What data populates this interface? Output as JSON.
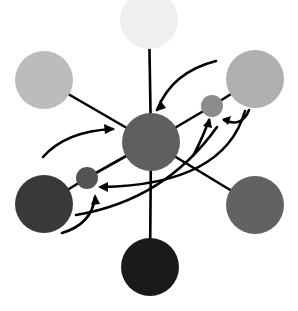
{
  "diagram": {
    "width": 298,
    "height": 311,
    "background": "#ffffff",
    "stroke_color": "#000000",
    "stroke_width": 2.6,
    "nodes": [
      {
        "id": "top",
        "cx": 149,
        "cy": 20,
        "r": 29,
        "fill": "#efefef"
      },
      {
        "id": "upper-left",
        "cx": 44,
        "cy": 80,
        "r": 29,
        "fill": "#bcbcbc"
      },
      {
        "id": "upper-right",
        "cx": 255,
        "cy": 79,
        "r": 29,
        "fill": "#b0b0b0"
      },
      {
        "id": "center",
        "cx": 151,
        "cy": 142,
        "r": 29,
        "fill": "#5f5f5f"
      },
      {
        "id": "small-right",
        "cx": 212,
        "cy": 106,
        "r": 11,
        "fill": "#8c8c8c"
      },
      {
        "id": "small-left",
        "cx": 87,
        "cy": 178,
        "r": 11,
        "fill": "#545454"
      },
      {
        "id": "lower-left",
        "cx": 44,
        "cy": 204,
        "r": 29,
        "fill": "#393939"
      },
      {
        "id": "lower-right",
        "cx": 255,
        "cy": 205,
        "r": 29,
        "fill": "#626262"
      },
      {
        "id": "bottom",
        "cx": 150,
        "cy": 267,
        "r": 29,
        "fill": "#1a1a1a"
      }
    ],
    "edges": [
      {
        "from": "top",
        "to": "center"
      },
      {
        "from": "upper-left",
        "to": "center"
      },
      {
        "from": "center",
        "to": "small-right"
      },
      {
        "from": "small-right",
        "to": "upper-right"
      },
      {
        "from": "center",
        "to": "small-left"
      },
      {
        "from": "small-left",
        "to": "lower-left"
      },
      {
        "from": "center",
        "to": "lower-right"
      },
      {
        "from": "center",
        "to": "bottom"
      }
    ],
    "arrows": [
      {
        "id": "arrow-upper-right-to-center",
        "d": "M 216 61 Q 172 72 157 110",
        "head": [
          157,
          111,
          160,
          100,
          166,
          108
        ]
      },
      {
        "id": "arrow-left-to-center",
        "d": "M 43 157 Q 66 131 113 129",
        "head": [
          115,
          129,
          104,
          124,
          105,
          134
        ]
      },
      {
        "id": "arrow-hook-to-small-right",
        "d": "M 249 110 Q 242 128 224 120",
        "head": [
          222,
          119,
          231,
          116,
          228,
          125
        ]
      },
      {
        "id": "arrow-up-to-small-right",
        "d": "M 193 156 Q 203 137 209 120",
        "head": [
          210,
          118,
          203,
          126,
          212,
          128
        ]
      },
      {
        "id": "arrow-sweep-to-small-left",
        "d": "M 245 111 Q 224 185 101 187",
        "head": [
          98,
          187,
          108,
          182,
          108,
          192
        ]
      },
      {
        "id": "arrow-lower-left-sweep",
        "d": "M 76 215 Q 165 200 217 127",
        "head": null
      },
      {
        "id": "arrow-curl-to-small-left",
        "d": "M 62 233 Q 92 224 95 197",
        "head": [
          95,
          194,
          91,
          205,
          100,
          204
        ]
      }
    ]
  }
}
